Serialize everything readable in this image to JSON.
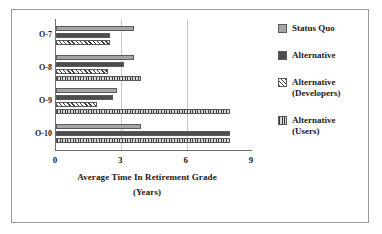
{
  "chart_data": {
    "type": "bar",
    "orientation": "horizontal",
    "title": "",
    "xlabel_line1": "Average Time In Retirement Grade",
    "xlabel_line2": "(Years)",
    "ylabel": "",
    "categories": [
      "O-7",
      "O-8",
      "O-9",
      "O-10"
    ],
    "xlim": [
      0,
      9
    ],
    "xticks": [
      0,
      3,
      6,
      9
    ],
    "xtick_labels": [
      "0",
      "3",
      "6",
      "9"
    ],
    "grid": "vertical gridlines at 3 and 6",
    "legend_position": "right",
    "series": [
      {
        "name": "Status Quo",
        "pattern": "solid-light-gray",
        "color": "#a6a6a6",
        "values": [
          3.6,
          3.6,
          2.8,
          3.9
        ]
      },
      {
        "name": "Alternative",
        "pattern": "solid-dark-gray",
        "color": "#4d4d4d",
        "values": [
          2.5,
          3.1,
          2.6,
          8.0
        ]
      },
      {
        "name": "Alternative (Developers)",
        "legend_line1": "Alternative",
        "legend_line2": "(Developers)",
        "pattern": "diagonal-hatch",
        "color": "#3d3d3d",
        "values": [
          2.5,
          2.4,
          1.9,
          null
        ]
      },
      {
        "name": "Alternative (Users)",
        "legend_line1": "Alternative",
        "legend_line2": "(Users)",
        "pattern": "vertical-stripes",
        "color": "#bdbdbd",
        "values": [
          null,
          3.9,
          8.0,
          8.0
        ]
      }
    ]
  },
  "legend": {
    "items": [
      {
        "label": "Status Quo",
        "sub": ""
      },
      {
        "label": "Alternative",
        "sub": ""
      },
      {
        "label": "Alternative",
        "sub": "(Developers)"
      },
      {
        "label": "Alternative",
        "sub": "(Users)"
      }
    ]
  }
}
